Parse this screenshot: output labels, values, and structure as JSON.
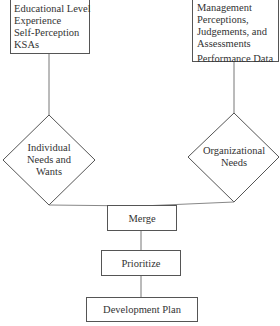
{
  "diagram": {
    "inputs": [
      {
        "id": "individual-inputs",
        "lines": [
          "Educational Level",
          "Experience",
          "Self-Perception",
          "KSAs"
        ]
      },
      {
        "id": "organizational-inputs",
        "lines": [
          "Management",
          "Perceptions,",
          "Judgements, and",
          "Assessments"
        ],
        "extra_line": "Performance Data"
      }
    ],
    "decisions": [
      {
        "id": "individual-needs",
        "lines": [
          "Individual",
          "Needs and",
          "Wants"
        ]
      },
      {
        "id": "organizational-needs",
        "lines": [
          "Organizational",
          "Needs"
        ]
      }
    ],
    "process": [
      {
        "id": "merge",
        "label": "Merge"
      },
      {
        "id": "prioritize",
        "label": "Prioritize"
      },
      {
        "id": "development-plan",
        "label": "Development Plan"
      }
    ],
    "edges": [
      [
        "individual-inputs",
        "individual-needs"
      ],
      [
        "organizational-inputs",
        "organizational-needs"
      ],
      [
        "individual-needs",
        "merge"
      ],
      [
        "organizational-needs",
        "merge"
      ],
      [
        "merge",
        "prioritize"
      ],
      [
        "prioritize",
        "development-plan"
      ]
    ],
    "colors": {
      "stroke": "#555555",
      "text": "#333333",
      "background": "#ffffff"
    }
  }
}
